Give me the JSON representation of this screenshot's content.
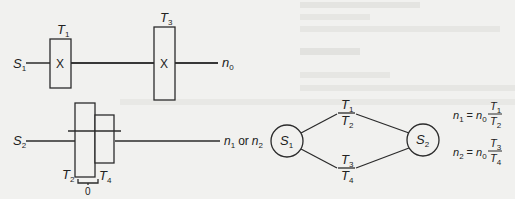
{
  "diagram": {
    "top_layout": {
      "input_shaft": {
        "label": "S",
        "sub": "1"
      },
      "gear_a": {
        "label": "T",
        "sub": "1",
        "mark": "X"
      },
      "gear_b": {
        "label": "T",
        "sub": "3",
        "mark": "X"
      },
      "output": {
        "label": "n",
        "sub": "0"
      }
    },
    "bottom_layout": {
      "shaft": {
        "label": "S",
        "sub": "2"
      },
      "gear_tall": {
        "label": "T",
        "sub": "2"
      },
      "gear_short": {
        "label": "T",
        "sub": "4"
      },
      "bracket_label": "0",
      "output": {
        "n1": "n",
        "n1_sub": "1",
        "or": "or",
        "n2": "n",
        "n2_sub": "2"
      }
    },
    "ray_diagram": {
      "node_left": {
        "label": "S",
        "sub": "1"
      },
      "node_right": {
        "label": "S",
        "sub": "2"
      },
      "upper_ratio": {
        "num": "T",
        "num_sub": "1",
        "den": "T",
        "den_sub": "2"
      },
      "lower_ratio": {
        "num": "T",
        "num_sub": "3",
        "den": "T",
        "den_sub": "4"
      }
    },
    "equations": [
      {
        "lhs": "n",
        "lhs_sub": "1",
        "eq": "=",
        "rhs": "n",
        "rhs_sub": "0",
        "num": "T",
        "num_sub": "1",
        "den": "T",
        "den_sub": "2"
      },
      {
        "lhs": "n",
        "lhs_sub": "2",
        "eq": "=",
        "rhs": "n",
        "rhs_sub": "0",
        "num": "T",
        "num_sub": "3",
        "den": "T",
        "den_sub": "4"
      }
    ]
  }
}
